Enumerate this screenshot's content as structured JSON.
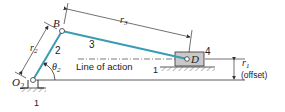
{
  "diagram": {
    "type": "offset slider-crank mechanism",
    "colors": {
      "link": "#3a9bb5",
      "line": "#333333",
      "block_fill": "#c9c9c9",
      "background": "#ffffff"
    },
    "labels": {
      "pivot_o2": "O",
      "pivot_o2_sub": "2",
      "joint_b": "B",
      "joint_d": "D",
      "link_2": "2",
      "link_3": "3",
      "slider_4": "4",
      "ground_crank": "1",
      "ground_slider": "1",
      "r2": "r",
      "r2_sub": "2",
      "r3": "r",
      "r3_sub": "3",
      "r1": "r",
      "r1_sub": "1",
      "offset": "(offset)",
      "theta": "θ",
      "theta_sub": "2",
      "line_of_action": "Line of action"
    }
  }
}
